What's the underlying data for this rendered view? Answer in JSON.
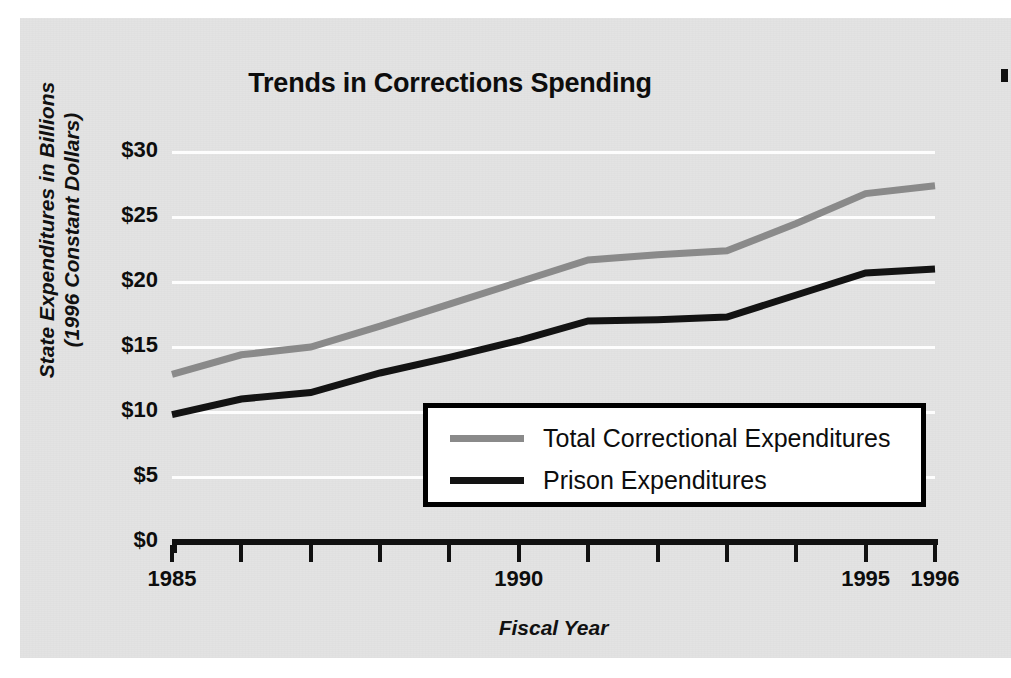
{
  "chart_data": {
    "type": "line",
    "title": "Trends in Corrections Spending",
    "xlabel": "Fiscal Year",
    "ylabel_line1": "State Expenditures in Billions",
    "ylabel_line2": "(1996 Constant Dollars)",
    "x": [
      1985,
      1986,
      1987,
      1988,
      1989,
      1990,
      1991,
      1992,
      1993,
      1994,
      1995,
      1996
    ],
    "xtick_labels": [
      "1985",
      "",
      "",
      "",
      "",
      "1990",
      "",
      "",
      "",
      "",
      "1995",
      "1996"
    ],
    "xlim": [
      1985,
      1996
    ],
    "ylim": [
      0,
      30
    ],
    "ytick_values": [
      0,
      5,
      10,
      15,
      20,
      25,
      30
    ],
    "ytick_labels": [
      "$0",
      "$5",
      "$10",
      "$15",
      "$20",
      "$25",
      "$30"
    ],
    "grid": "horizontal-only-white",
    "legend_position": "center-lower",
    "series": [
      {
        "name": "Total Correctional Expenditures",
        "color": "#8a8a8a",
        "values": [
          12.9,
          14.4,
          15.0,
          16.6,
          18.3,
          20.0,
          21.7,
          22.1,
          22.4,
          24.5,
          26.8,
          27.4
        ]
      },
      {
        "name": "Prison Expenditures",
        "color": "#131313",
        "values": [
          9.8,
          11.0,
          11.5,
          13.0,
          14.2,
          15.5,
          17.0,
          17.1,
          17.3,
          19.0,
          20.7,
          21.0
        ]
      }
    ]
  },
  "legend": {
    "items": [
      {
        "label": "Total Correctional Expenditures",
        "color": "#8a8a8a"
      },
      {
        "label": "Prison Expenditures",
        "color": "#131313"
      }
    ]
  },
  "colors": {
    "panel_background": "#e3e3e3",
    "gridline": "#fdfdfd",
    "axis": "#111111",
    "total_series": "#8a8a8a",
    "prison_series": "#131313",
    "legend_background": "#ffffff",
    "legend_border": "#000000"
  }
}
